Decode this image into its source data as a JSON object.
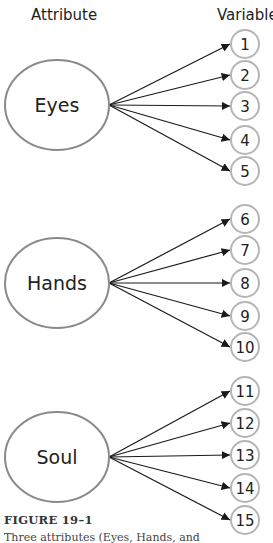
{
  "headers": {
    "attribute": "Attribute",
    "variable": "Variable"
  },
  "attributes": [
    {
      "label": "Eyes",
      "cx": 57,
      "cy": 105,
      "variables": [
        {
          "label": "1",
          "cy": 44
        },
        {
          "label": "2",
          "cy": 75
        },
        {
          "label": "3",
          "cy": 106
        },
        {
          "label": "4",
          "cy": 140
        },
        {
          "label": "5",
          "cy": 171
        }
      ]
    },
    {
      "label": "Hands",
      "cx": 57,
      "cy": 283,
      "variables": [
        {
          "label": "6",
          "cy": 219
        },
        {
          "label": "7",
          "cy": 250
        },
        {
          "label": "8",
          "cy": 283
        },
        {
          "label": "9",
          "cy": 316
        },
        {
          "label": "10",
          "cy": 347
        }
      ]
    },
    {
      "label": "Soul",
      "cx": 57,
      "cy": 457,
      "variables": [
        {
          "label": "11",
          "cy": 391
        },
        {
          "label": "12",
          "cy": 423
        },
        {
          "label": "13",
          "cy": 455
        },
        {
          "label": "14",
          "cy": 488
        },
        {
          "label": "15",
          "cy": 520
        }
      ]
    }
  ],
  "caption": {
    "title": "FIGURE 19–1",
    "text": "Three attributes (Eyes, Hands, and"
  },
  "colors": {
    "ellipse_stroke": "#8a8a8a",
    "circle_stroke": "#b5b5b5",
    "arrow": "#1a1a1a",
    "text": "#222222"
  }
}
